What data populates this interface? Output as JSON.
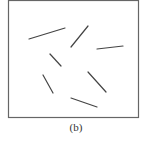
{
  "figure": {
    "caption": "(b)",
    "frame": {
      "x": 8,
      "y": 0,
      "width": 130,
      "height": 117,
      "stroke": "#666666"
    },
    "segment_color": "#444444",
    "segments": [
      {
        "x1": 29,
        "y1": 39,
        "x2": 65,
        "y2": 28
      },
      {
        "x1": 71,
        "y1": 47,
        "x2": 88,
        "y2": 26
      },
      {
        "x1": 97,
        "y1": 49,
        "x2": 123,
        "y2": 46
      },
      {
        "x1": 50,
        "y1": 54,
        "x2": 61,
        "y2": 66
      },
      {
        "x1": 43,
        "y1": 75,
        "x2": 53,
        "y2": 93
      },
      {
        "x1": 88,
        "y1": 72,
        "x2": 106,
        "y2": 92
      },
      {
        "x1": 71,
        "y1": 98,
        "x2": 97,
        "y2": 107
      }
    ]
  }
}
